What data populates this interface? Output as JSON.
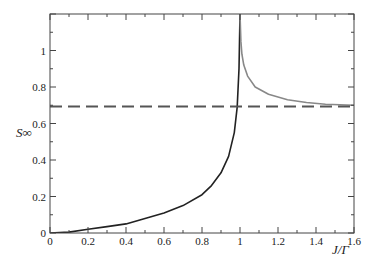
{
  "chart_data": {
    "type": "line",
    "title": "",
    "xlabel": "J/Γ",
    "ylabel": "S∞",
    "xlim": [
      0,
      1.6
    ],
    "ylim": [
      0,
      1.2
    ],
    "grid": false,
    "legend": null,
    "x_ticks": [
      "0",
      "0.2",
      "0.4",
      "0.6",
      "0.8",
      "1",
      "1.2",
      "1.4",
      "1.6"
    ],
    "y_ticks": [
      "0",
      "0.2",
      "0.4",
      "0.6",
      "0.8",
      "1"
    ],
    "series": [
      {
        "name": "S_inf (J < Gamma)",
        "style": "solid",
        "color": "#222222",
        "x": [
          0,
          0.1,
          0.2,
          0.3,
          0.4,
          0.5,
          0.6,
          0.7,
          0.8,
          0.85,
          0.9,
          0.94,
          0.97,
          0.985,
          0.995,
          1.0
        ],
        "y": [
          0,
          0.005,
          0.02,
          0.035,
          0.05,
          0.08,
          0.11,
          0.15,
          0.21,
          0.26,
          0.33,
          0.42,
          0.55,
          0.69,
          0.9,
          1.2
        ]
      },
      {
        "name": "S_inf (J > Gamma)",
        "style": "solid",
        "color": "#888888",
        "x": [
          1.0,
          1.005,
          1.01,
          1.02,
          1.04,
          1.08,
          1.15,
          1.25,
          1.35,
          1.45,
          1.6
        ],
        "y": [
          1.2,
          1.05,
          0.98,
          0.92,
          0.86,
          0.8,
          0.76,
          0.73,
          0.715,
          0.705,
          0.7
        ]
      },
      {
        "name": "ln 2",
        "style": "dashed",
        "color": "#555555",
        "x": [
          0,
          1.6
        ],
        "y": [
          0.693,
          0.693
        ]
      }
    ]
  }
}
